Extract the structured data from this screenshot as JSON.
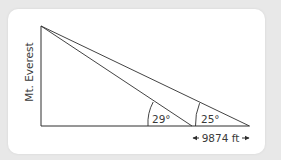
{
  "diagram": {
    "vertical_label": "Mt. Everest",
    "angle_near": "29°",
    "angle_far": "25°",
    "distance_label": "9874 ft",
    "line_color": "#2e2e2e",
    "background_color": "#e8e8e8",
    "card_color": "#ffffff"
  }
}
